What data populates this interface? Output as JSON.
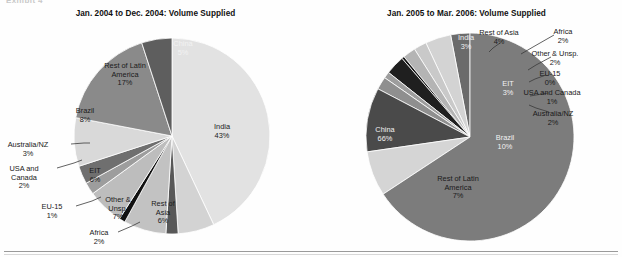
{
  "exhibit": {
    "caption": "Exhibit 4"
  },
  "figure": {
    "width": 622,
    "height": 257,
    "background": "#fefefe",
    "rule_color": "#9a9a9a"
  },
  "palette": {
    "india": "#e2e2e2",
    "rest_of_asia": "#d3d3d3",
    "africa": "#585858",
    "other_unsp": "#c2c2c2",
    "eu15": "#111111",
    "eit": "#bdbdbd",
    "usa_canada": "#9d9d9d",
    "australia_nz": "#6f6f6f",
    "brazil": "#d9d9d9",
    "rest_latin": "#8a8a8a",
    "china": "#5e5e5e",
    "china_big": "#7c7c7c",
    "brazil_big": "#4a4a4a",
    "eit_dark": "#1f1f1f",
    "india_small": "#6b6b6b",
    "stroke": "#ffffff"
  },
  "chart_data": [
    {
      "type": "pie",
      "id": "left",
      "title": "Jan. 2004 to Dec. 2004: Volume Supplied",
      "start_angle_deg": 0,
      "direction": "clockwise",
      "categories": [
        "India",
        "Rest of Asia",
        "Africa",
        "Other & Unsp.",
        "EU-15",
        "EIT",
        "USA and Canada",
        "Australia/NZ",
        "Brazil",
        "Rest of Latin America",
        "China"
      ],
      "values": [
        43,
        6,
        2,
        7,
        1,
        6,
        2,
        3,
        8,
        17,
        5
      ],
      "value_labels": [
        "43%",
        "6%",
        "2%",
        "7%",
        "1%",
        "6%",
        "2%",
        "3%",
        "8%",
        "17%",
        "5%"
      ],
      "colors": [
        "#e2e2e2",
        "#d3d3d3",
        "#585858",
        "#c2c2c2",
        "#111111",
        "#bdbdbd",
        "#9d9d9d",
        "#6f6f6f",
        "#d9d9d9",
        "#8a8a8a",
        "#5e5e5e"
      ],
      "labels": [
        {
          "name": "India",
          "text": "India\n43%",
          "x": 222,
          "y": 123,
          "style": "dark",
          "placement": "inside"
        },
        {
          "name": "Rest of Asia",
          "text": "Rest of\nAsia\n6%",
          "x": 163,
          "y": 200,
          "style": "dark",
          "placement": "inside"
        },
        {
          "name": "Africa",
          "text": "Africa\n2%",
          "x": 99,
          "y": 229,
          "style": "dark",
          "placement": "outside-left",
          "leader": [
            [
              118,
              232
            ],
            [
              132,
              226
            ],
            [
              140,
              222
            ]
          ]
        },
        {
          "name": "Other & Unsp.",
          "text": "Other &\nUnsp.\n7%",
          "x": 118,
          "y": 196,
          "style": "dark",
          "placement": "inside"
        },
        {
          "name": "EU-15",
          "text": "EU-15\n1%",
          "x": 52,
          "y": 203,
          "style": "dark",
          "placement": "outside-left",
          "leader": [
            [
              76,
              206
            ],
            [
              92,
              201
            ],
            [
              101,
              197
            ]
          ]
        },
        {
          "name": "EIT",
          "text": "EIT\n6%",
          "x": 95,
          "y": 167,
          "style": "dark",
          "placement": "inside"
        },
        {
          "name": "USA and Canada",
          "text": "USA and\nCanada\n2%",
          "x": 24,
          "y": 165,
          "style": "dark",
          "placement": "outside-left",
          "leader": [
            [
              57,
              168
            ],
            [
              74,
              163
            ],
            [
              82,
              160
            ]
          ]
        },
        {
          "name": "Australia/NZ",
          "text": "Australia/NZ\n3%",
          "x": 28,
          "y": 141,
          "style": "dark",
          "placement": "outside-left",
          "leader": [
            [
              71,
              144
            ],
            [
              84,
              143
            ],
            [
              90,
              143
            ]
          ]
        },
        {
          "name": "Brazil",
          "text": "Brazil\n8%",
          "x": 85,
          "y": 107,
          "style": "dark",
          "placement": "inside"
        },
        {
          "name": "Rest of Latin America",
          "text": "Rest of Latin\nAmerica\n17%",
          "x": 125,
          "y": 62,
          "style": "dark",
          "placement": "inside"
        },
        {
          "name": "China",
          "text": "China\n5%",
          "x": 183,
          "y": 40,
          "style": "light",
          "placement": "inside"
        }
      ]
    },
    {
      "type": "pie",
      "id": "right",
      "title": "Jan. 2005 to Mar. 2006: Volume Supplied",
      "start_angle_deg": 0,
      "direction": "counterclockwise",
      "categories": [
        "India",
        "Rest of Asia",
        "Africa",
        "Other & Unsp.",
        "EU-15",
        "EIT",
        "USA and Canada",
        "Australia/NZ",
        "Brazil",
        "Rest of Latin America",
        "China"
      ],
      "values": [
        3,
        4,
        2,
        2,
        0.4,
        3,
        1,
        2,
        10,
        7,
        66
      ],
      "value_labels": [
        "3%",
        "4%",
        "2%",
        "2%",
        "0%",
        "3%",
        "1%",
        "2%",
        "10%",
        "7%",
        "66%"
      ],
      "colors": [
        "#6b6b6b",
        "#d3d3d3",
        "#c9c9c9",
        "#b4b4b4",
        "#111111",
        "#1f1f1f",
        "#9d9d9d",
        "#8f8f8f",
        "#4a4a4a",
        "#d5d5d5",
        "#7c7c7c"
      ],
      "labels": [
        {
          "name": "India",
          "text": "India\n3%",
          "x": 466,
          "y": 34,
          "style": "light",
          "placement": "inside"
        },
        {
          "name": "Rest of Asia",
          "text": "Rest of Asia\n4%",
          "x": 499,
          "y": 29,
          "style": "dark",
          "placement": "outside-top",
          "leader": [
            [
              500,
              43
            ],
            [
              493,
              48
            ],
            [
              489,
              52
            ]
          ]
        },
        {
          "name": "Africa",
          "text": "Africa\n2%",
          "x": 563,
          "y": 28,
          "style": "dark",
          "placement": "outside-right",
          "leader": [
            [
              554,
              35
            ],
            [
              533,
              47
            ],
            [
              521,
              54
            ]
          ]
        },
        {
          "name": "Other & Unsp.",
          "text": "Other & Unsp.\n2%",
          "x": 555,
          "y": 50,
          "style": "dark",
          "placement": "outside-right",
          "leader": [
            [
              551,
              57
            ],
            [
              536,
              65
            ],
            [
              528,
              70
            ]
          ]
        },
        {
          "name": "EU-15",
          "text": "EU-15\n0%",
          "x": 550,
          "y": 70,
          "style": "dark",
          "placement": "outside-right",
          "leader": [
            [
              546,
              75
            ],
            [
              535,
              79
            ],
            [
              529,
              82
            ]
          ]
        },
        {
          "name": "EIT",
          "text": "EIT\n3%",
          "x": 508,
          "y": 80,
          "style": "light",
          "placement": "inside"
        },
        {
          "name": "USA and Canada",
          "text": "USA and Canada\n1%",
          "x": 552,
          "y": 89,
          "style": "dark",
          "placement": "outside-right",
          "leader": [
            [
              548,
              93
            ],
            [
              536,
              95
            ],
            [
              530,
              96
            ]
          ]
        },
        {
          "name": "Australia/NZ",
          "text": "Australia/NZ\n2%",
          "x": 553,
          "y": 110,
          "style": "dark",
          "placement": "outside-right",
          "leader": [
            [
              549,
              112
            ],
            [
              536,
              108
            ],
            [
              529,
              105
            ]
          ]
        },
        {
          "name": "Brazil",
          "text": "Brazil\n10%",
          "x": 505,
          "y": 134,
          "style": "light",
          "placement": "inside"
        },
        {
          "name": "Rest of Latin America",
          "text": "Rest of Latin\nAmerica\n7%",
          "x": 458,
          "y": 175,
          "style": "dark",
          "placement": "inside"
        },
        {
          "name": "China",
          "text": "China\n66%",
          "x": 385,
          "y": 126,
          "style": "light",
          "placement": "inside"
        }
      ]
    }
  ],
  "geometry": {
    "left_pie": {
      "cx": 172,
      "cy": 136,
      "r": 98
    },
    "right_pie": {
      "cx": 470,
      "cy": 137,
      "r": 104
    }
  }
}
